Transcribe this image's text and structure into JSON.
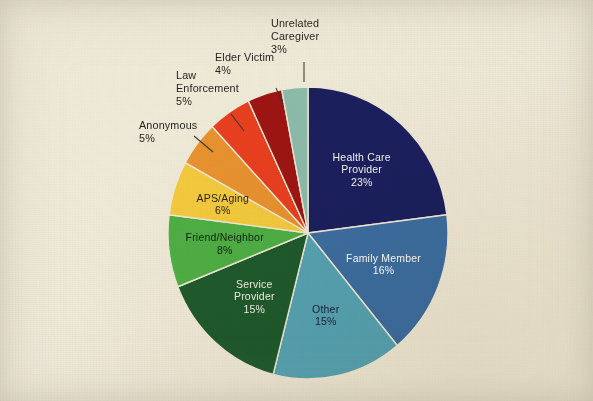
{
  "figure": {
    "background_color": "#efe9d8",
    "kind": "scanned-pie-chart"
  },
  "chart_data": {
    "type": "pie",
    "title": "",
    "subtitle": "",
    "xlabel": "",
    "ylabel": "",
    "legend_position": "none",
    "grid": false,
    "units": "percent",
    "total": 100,
    "start_angle_deg": 0,
    "direction": "clockwise",
    "categories": [
      "Health Care Provider",
      "Family Member",
      "Other",
      "Service Provider",
      "Friend/Neighbor",
      "APS/Aging",
      "Anonymous",
      "Law Enforcement",
      "Elder Victim",
      "Unrelated Caregiver"
    ],
    "values": [
      23,
      16,
      15,
      15,
      8,
      6,
      5,
      5,
      4,
      3
    ],
    "colors": [
      "#1b1f5e",
      "#3d6ea3",
      "#57a3b5",
      "#1f5a2c",
      "#4faf45",
      "#f3ca3e",
      "#e8922f",
      "#e8401f",
      "#9d1513",
      "#8cbcab"
    ],
    "slices": [
      {
        "label": "Health Care Provider",
        "label_line1": "Health Care",
        "label_line2": "Provider",
        "value": 23,
        "value_label": "23%",
        "color": "#1b1f5e",
        "label_placement": "inside",
        "text_color": "#f4f4f2"
      },
      {
        "label": "Family Member",
        "label_line1": "Family Member",
        "label_line2": "",
        "value": 16,
        "value_label": "16%",
        "color": "#3d6ea3",
        "label_placement": "inside",
        "text_color": "#ffffff"
      },
      {
        "label": "Other",
        "label_line1": "Other",
        "label_line2": "",
        "value": 15,
        "value_label": "15%",
        "color": "#57a3b5",
        "label_placement": "inside",
        "text_color": "#17203a"
      },
      {
        "label": "Service Provider",
        "label_line1": "Service",
        "label_line2": "Provider",
        "value": 15,
        "value_label": "15%",
        "color": "#1f5a2c",
        "label_placement": "inside",
        "text_color": "#f2f1e6"
      },
      {
        "label": "Friend/Neighbor",
        "label_line1": "Friend/Neighbor",
        "label_line2": "",
        "value": 8,
        "value_label": "8%",
        "color": "#4faf45",
        "label_placement": "inside",
        "text_color": "#10240f"
      },
      {
        "label": "APS/Aging",
        "label_line1": "APS/Aging",
        "label_line2": "",
        "value": 6,
        "value_label": "6%",
        "color": "#f3ca3e",
        "label_placement": "inside",
        "text_color": "#2a2410"
      },
      {
        "label": "Anonymous",
        "label_line1": "Anonymous",
        "label_line2": "",
        "value": 5,
        "value_label": "5%",
        "color": "#e8922f",
        "label_placement": "outside",
        "text_color": "#262420"
      },
      {
        "label": "Law Enforcement",
        "label_line1": "Law",
        "label_line2": "Enforcement",
        "value": 5,
        "value_label": "5%",
        "color": "#e8401f",
        "label_placement": "outside",
        "text_color": "#262420"
      },
      {
        "label": "Elder Victim",
        "label_line1": "Elder Victim",
        "label_line2": "",
        "value": 4,
        "value_label": "4%",
        "color": "#9d1513",
        "label_placement": "outside",
        "text_color": "#262420"
      },
      {
        "label": "Unrelated Caregiver",
        "label_line1": "Unrelated",
        "label_line2": "Caregiver",
        "value": 3,
        "value_label": "3%",
        "color": "#8cbcab",
        "label_placement": "outside",
        "text_color": "#262420"
      }
    ]
  },
  "geometry": {
    "center_x": 308,
    "center_y": 233,
    "radius_x": 140,
    "radius_y": 146
  }
}
